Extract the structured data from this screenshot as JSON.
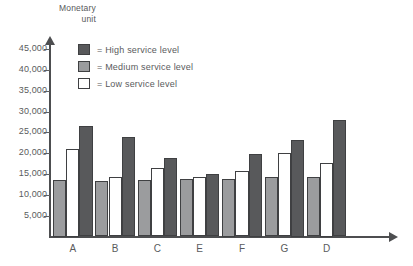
{
  "chart_data": {
    "type": "bar",
    "title": "",
    "xlabel": "",
    "ylabel": "Monetary unit",
    "ylabel_line1": "Monetary",
    "ylabel_line2": "unit",
    "categories": [
      "A",
      "B",
      "C",
      "E",
      "F",
      "G",
      "D"
    ],
    "series": [
      {
        "name": "Medium service level",
        "legend_label": "= Medium service level",
        "color": "#9b9c9e",
        "values": [
          13500,
          13400,
          13600,
          13700,
          13800,
          14200,
          14300
        ]
      },
      {
        "name": "Low service level",
        "legend_label": "= Low service level",
        "color": "#ffffff",
        "values": [
          21000,
          14300,
          16400,
          14200,
          15800,
          20000,
          17700
        ]
      },
      {
        "name": "High service level",
        "legend_label": "= High service level",
        "color": "#58595b",
        "values": [
          26500,
          23800,
          18800,
          15100,
          19800,
          23100,
          28000
        ]
      }
    ],
    "ylim": [
      0,
      46500
    ],
    "yticks": [
      5000,
      10000,
      15000,
      20000,
      25000,
      30000,
      35000,
      40000,
      45000
    ],
    "ytick_labels": [
      "5,000",
      "10,000",
      "15,000",
      "20,000",
      "25,000",
      "30,000",
      "35,000",
      "40,000",
      "45,000"
    ],
    "grid": false,
    "legend_position": "top-left-inside",
    "bar_order_in_group": [
      "Medium service level",
      "Low service level",
      "High service level"
    ]
  },
  "legend": {
    "items": [
      {
        "label": "= High service level",
        "swatch": "high",
        "swatch_name": "legend-swatch-high"
      },
      {
        "label": "= Medium service level",
        "swatch": "medium",
        "swatch_name": "legend-swatch-medium"
      },
      {
        "label": "= Low service level",
        "swatch": "low",
        "swatch_name": "legend-swatch-low"
      }
    ]
  },
  "colors": {
    "high": "#58595b",
    "medium": "#9b9c9e",
    "low": "#ffffff",
    "axis": "#4d4e50",
    "text": "#5a5b5d",
    "background": "#ffffff"
  }
}
